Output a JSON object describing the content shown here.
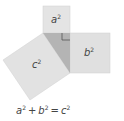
{
  "diagram": {
    "squares": [
      {
        "id": "a",
        "label": "a",
        "exp": "2",
        "fill": "#e4e4e4"
      },
      {
        "id": "b",
        "label": "b",
        "exp": "2",
        "fill": "#e0e0e0"
      },
      {
        "id": "c",
        "label": "c",
        "exp": "2",
        "fill": "#e2e2e2"
      }
    ],
    "triangle": {
      "fill": "#b0b0b0",
      "right_angle_marker": true
    },
    "equation": {
      "a": "a",
      "plus": "+",
      "b": "b",
      "equals": "=",
      "c": "c",
      "exp": "2"
    }
  }
}
